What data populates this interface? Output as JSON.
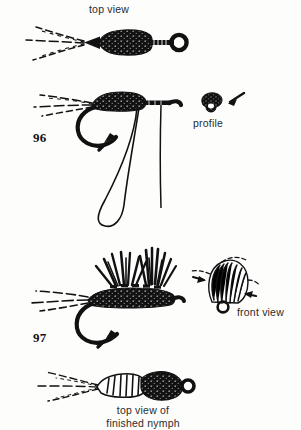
{
  "page": {
    "kind": "fly-tying-instructional-plate",
    "background_color": "#fdfdfc",
    "ink_color": "#111111",
    "text_color": "#2b2b2b"
  },
  "labels": {
    "top_view": "top view",
    "profile": "profile",
    "front_view": "front view",
    "finished_nymph_line1": "top view of",
    "finished_nymph_line2": "finished nymph"
  },
  "figures": {
    "number_96": "96",
    "number_97": "97"
  },
  "panels": [
    {
      "id": "panel-top-view",
      "label": "top view",
      "description": "dorsal view of weighted nymph body with three splayed tails and hook eye"
    },
    {
      "id": "panel-96",
      "label": "96",
      "description": "side view of hook with dubbed thorax, hanging dubbing loop and tying thread"
    },
    {
      "id": "panel-profile",
      "label": "profile",
      "description": "small head-on profile of thorax with arrow pointing to it"
    },
    {
      "id": "panel-97",
      "label": "97",
      "description": "side view of nymph with two clumps of splayed hackle fibre legs"
    },
    {
      "id": "panel-front-view",
      "label": "front view",
      "description": "front-on view of hackle fibres splayed around hook eye with arrows"
    },
    {
      "id": "panel-finished",
      "label": "top view of finished nymph",
      "description": "dorsal view of completed nymph with segmented abdomen and dark thorax"
    }
  ],
  "icons": {
    "pointer_arrow": "arrow-icon",
    "hook_eye": "hook-eye-icon"
  }
}
